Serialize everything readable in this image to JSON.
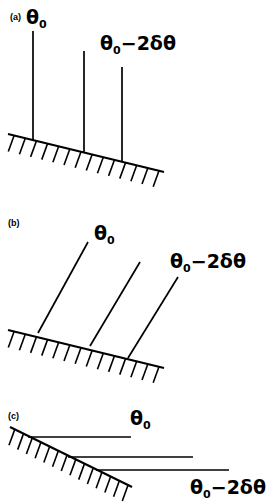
{
  "figure": {
    "width": 268,
    "height": 503,
    "background": "#ffffff",
    "ink": "#000000"
  },
  "panels": [
    {
      "tag": "(a)",
      "tag_x": 10,
      "tag_y": 20,
      "labels": [
        {
          "name": "theta-0",
          "base": "θ",
          "sub": "0",
          "tail": "",
          "x": 26,
          "y": 24
        },
        {
          "name": "theta-0-minus-2-delta-theta",
          "base": "θ",
          "sub": "0",
          "tail": "−2δθ",
          "x": 100,
          "y": 50
        }
      ],
      "ground": {
        "x1": 8,
        "y1": 134,
        "x2": 164,
        "y2": 172
      },
      "hatch_count": 14,
      "hatch_len": 17,
      "hatch_angle_deg": 250,
      "rays": [
        {
          "name": "ray-theta-0",
          "x1": 33,
          "y1": 31,
          "x2": 33,
          "y2": 140
        },
        {
          "name": "ray-middle",
          "x1": 84,
          "y1": 51,
          "x2": 84,
          "y2": 152
        },
        {
          "name": "ray-theta-0-minus-2-delta-theta",
          "x1": 122,
          "y1": 67,
          "x2": 122,
          "y2": 162
        }
      ]
    },
    {
      "tag": "(b)",
      "tag_x": 8,
      "tag_y": 226,
      "labels": [
        {
          "name": "theta-0",
          "base": "θ",
          "sub": "0",
          "tail": "",
          "x": 94,
          "y": 240
        },
        {
          "name": "theta-0-minus-2-delta-theta",
          "base": "θ",
          "sub": "0",
          "tail": "−2δθ",
          "x": 170,
          "y": 268
        }
      ],
      "ground": {
        "x1": 8,
        "y1": 330,
        "x2": 164,
        "y2": 368
      },
      "hatch_count": 14,
      "hatch_len": 17,
      "hatch_angle_deg": 250,
      "rays": [
        {
          "name": "ray-theta-0",
          "x1": 88,
          "y1": 242,
          "x2": 38,
          "y2": 333
        },
        {
          "name": "ray-middle",
          "x1": 140,
          "y1": 262,
          "x2": 90,
          "y2": 346
        },
        {
          "name": "ray-theta-0-minus-2-delta-theta",
          "x1": 178,
          "y1": 277,
          "x2": 128,
          "y2": 358
        }
      ]
    },
    {
      "tag": "(c)",
      "tag_x": 8,
      "tag_y": 419,
      "labels": [
        {
          "name": "theta-0",
          "base": "θ",
          "sub": "0",
          "tail": "",
          "x": 130,
          "y": 425
        },
        {
          "name": "theta-0-minus-2-delta-theta",
          "base": "θ",
          "sub": "0",
          "tail": "−2δθ",
          "x": 190,
          "y": 494
        }
      ],
      "ground": {
        "x1": 10,
        "y1": 427,
        "x2": 132,
        "y2": 487
      },
      "hatch_count": 14,
      "hatch_len": 17,
      "hatch_angle_deg": 250,
      "rays": [
        {
          "name": "ray-theta-0",
          "x1": 131,
          "y1": 437,
          "x2": 28,
          "y2": 437
        },
        {
          "name": "ray-middle",
          "x1": 193,
          "y1": 457,
          "x2": 68,
          "y2": 457
        },
        {
          "name": "ray-theta-0-minus-2-delta-theta",
          "x1": 229,
          "y1": 470,
          "x2": 96,
          "y2": 470
        }
      ]
    }
  ]
}
